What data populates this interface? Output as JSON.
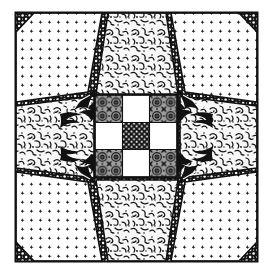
{
  "artwork": {
    "title": "Symmetric Quilt Block Pattern",
    "caption": "",
    "canvas": {
      "width": 270,
      "height": 271,
      "background": "#ffffff"
    },
    "frame": {
      "name": "outer-frame",
      "x": 15,
      "y": 12,
      "width": 243,
      "height": 250,
      "stroke": "#111111",
      "stroke_width": 2,
      "fill": "#ffffff"
    },
    "palette": {
      "ink": "#111111",
      "paper": "#ffffff",
      "dark_stipple_bg": "#141414",
      "dark_stipple_dot": "#ffffff",
      "light_dot_bg": "#ffffff",
      "light_dot_ink": "#1a1a1a",
      "mottle_bg": "#f7f7f7",
      "mottle_ink": "#1a1a1a",
      "damask_bg": "#9a9a9a",
      "damask_ink": "#111111",
      "checker_dark_bg": "#151515",
      "checker_dark_dot": "#ffffff"
    },
    "regions": [
      {
        "name": "corner-wedge-top-left",
        "fill": "dark-stipple",
        "role": "dark corner wedge"
      },
      {
        "name": "corner-wedge-top-right",
        "fill": "dark-stipple",
        "role": "dark corner wedge"
      },
      {
        "name": "corner-wedge-bottom-left",
        "fill": "dark-stipple",
        "role": "dark corner wedge"
      },
      {
        "name": "corner-wedge-bottom-right",
        "fill": "dark-stipple",
        "role": "dark corner wedge"
      },
      {
        "name": "pentagon-top-left",
        "fill": "light-dot",
        "role": "dotted corner pentagon"
      },
      {
        "name": "pentagon-top-right",
        "fill": "light-dot",
        "role": "dotted corner pentagon"
      },
      {
        "name": "pentagon-bottom-left",
        "fill": "light-dot",
        "role": "dotted corner pentagon"
      },
      {
        "name": "pentagon-bottom-right",
        "fill": "light-dot",
        "role": "dotted corner pentagon"
      },
      {
        "name": "trapezoid-top",
        "fill": "mottle",
        "role": "mottled edge trapezoid"
      },
      {
        "name": "trapezoid-bottom",
        "fill": "mottle",
        "role": "mottled edge trapezoid"
      },
      {
        "name": "trapezoid-left",
        "fill": "mottle",
        "role": "mottled edge trapezoid"
      },
      {
        "name": "trapezoid-right",
        "fill": "mottle",
        "role": "mottled edge trapezoid"
      },
      {
        "name": "acanthus-ornament-top-left",
        "fill": "ink",
        "role": "leaf scroll ornament"
      },
      {
        "name": "acanthus-ornament-top-right",
        "fill": "ink",
        "role": "leaf scroll ornament"
      },
      {
        "name": "acanthus-ornament-bottom-left",
        "fill": "ink",
        "role": "leaf scroll ornament"
      },
      {
        "name": "acanthus-ornament-bottom-right",
        "fill": "ink",
        "role": "leaf scroll ornament"
      }
    ],
    "checkerboard": {
      "name": "center-checkerboard",
      "x": 95,
      "y": 95,
      "cell": 27.3,
      "rows": 3,
      "cols": 3,
      "cells": [
        [
          "damask",
          "white",
          "damask"
        ],
        [
          "white",
          "dark-dot",
          "white"
        ],
        [
          "damask",
          "white",
          "damask"
        ]
      ]
    }
  }
}
